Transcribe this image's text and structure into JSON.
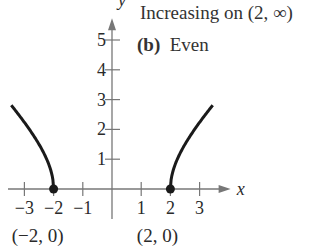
{
  "annotations": {
    "line1": "Increasing on (2, ∞)",
    "part_label": "(b)",
    "part_text": "Even"
  },
  "chart_data": {
    "type": "line",
    "title": "",
    "xlabel": "x",
    "ylabel": "y",
    "xlim": [
      -3.8,
      4.2
    ],
    "ylim": [
      -0.6,
      5.8
    ],
    "grid": false,
    "x_ticks": [
      -3,
      -2,
      -1,
      1,
      2,
      3
    ],
    "x_tick_labels": [
      "−3",
      "−2",
      "−1",
      "1",
      "2",
      "3"
    ],
    "y_ticks": [
      1,
      2,
      3,
      4,
      5
    ],
    "y_tick_labels": [
      "1",
      "2",
      "3",
      "4",
      "5"
    ],
    "series": [
      {
        "name": "left-branch",
        "function": "sqrt(x^2-4)",
        "x_range": [
          -3.45,
          -2
        ]
      },
      {
        "name": "right-branch",
        "function": "sqrt(x^2-4)",
        "x_range": [
          2,
          3.45
        ]
      }
    ],
    "points": [
      {
        "x": -2,
        "y": 0,
        "label": "(−2, 0)"
      },
      {
        "x": 2,
        "y": 0,
        "label": "(2, 0)"
      }
    ],
    "colors": {
      "axis": "#777777",
      "curve": "#1a1a1a"
    }
  }
}
